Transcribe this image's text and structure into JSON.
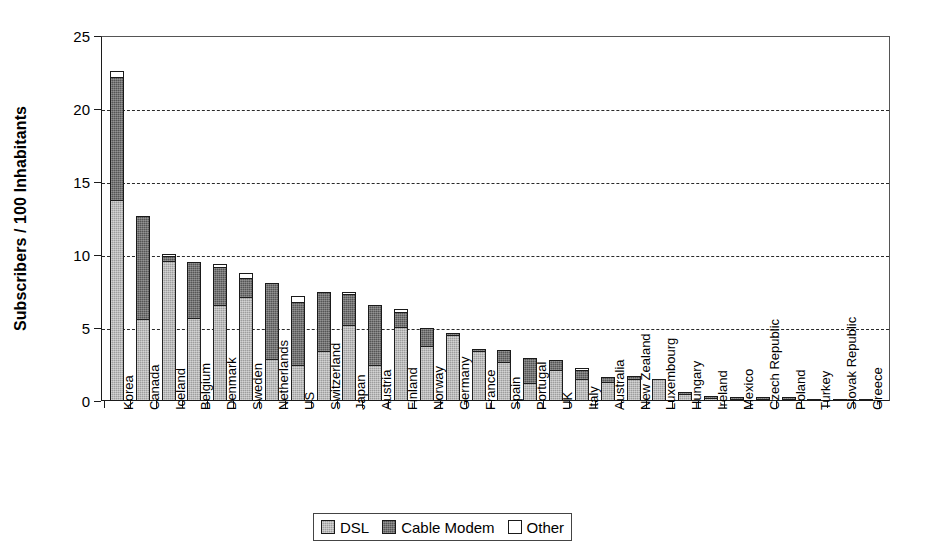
{
  "chart_data": {
    "type": "bar",
    "subtype": "stacked-vertical",
    "title": "",
    "xlabel": "",
    "ylabel": "Subscribers / 100 Inhabitants",
    "ylim": [
      0,
      25
    ],
    "yticks": [
      0,
      5,
      10,
      15,
      20,
      25
    ],
    "grid": "horizontal-dashed",
    "legend_position": "bottom-center",
    "categories": [
      "Korea",
      "Canada",
      "Iceland",
      "Belgium",
      "Denmark",
      "Sweden",
      "Netherlands",
      "US",
      "Switzerland",
      "Japan",
      "Austria",
      "Finland",
      "Norway",
      "Germany",
      "France",
      "Spain",
      "Portugal",
      "UK",
      "Italy",
      "Australia",
      "New Zealand",
      "Luxembourg",
      "Hungary",
      "Ireland",
      "Mexico",
      "Czech Republic",
      "Poland",
      "Turkey",
      "Slovak Republic",
      "Greece"
    ],
    "series": [
      {
        "name": "DSL",
        "color": "#9d9d9d",
        "values": [
          13.8,
          5.6,
          9.6,
          5.7,
          6.6,
          7.1,
          2.9,
          2.5,
          3.4,
          5.2,
          2.5,
          5.1,
          3.8,
          4.55,
          3.4,
          2.7,
          1.2,
          2.1,
          1.5,
          1.3,
          1.5,
          1.5,
          0.45,
          0.2,
          0.06,
          0.05,
          0.06,
          0.02,
          0.02,
          0.02
        ]
      },
      {
        "name": "Cable Modem",
        "color": "#555555",
        "values": [
          8.4,
          7.1,
          0.35,
          3.8,
          2.6,
          1.3,
          5.2,
          4.3,
          4.1,
          2.1,
          4.1,
          1.0,
          1.2,
          0.05,
          0.1,
          0.8,
          1.75,
          0.7,
          0.65,
          0.35,
          0.2,
          0.0,
          0.1,
          0.05,
          0.09,
          0.05,
          0.02,
          0.0,
          0.0,
          0.0
        ]
      },
      {
        "name": "Other",
        "color": "#ffffff",
        "values": [
          0.4,
          0.0,
          0.15,
          0.0,
          0.2,
          0.4,
          0.0,
          0.4,
          0.0,
          0.1,
          0.0,
          0.2,
          0.0,
          0.0,
          0.0,
          0.0,
          0.0,
          0.0,
          0.05,
          0.0,
          0.0,
          0.0,
          0.0,
          0.0,
          0.0,
          0.0,
          0.0,
          0.0,
          0.0,
          0.0
        ]
      }
    ],
    "totals": [
      22.6,
      12.7,
      10.1,
      9.5,
      9.4,
      8.8,
      8.1,
      7.2,
      7.5,
      7.4,
      6.6,
      6.3,
      5.0,
      4.6,
      3.5,
      3.5,
      2.95,
      2.8,
      2.2,
      1.65,
      1.7,
      1.5,
      0.55,
      0.25,
      0.15,
      0.1,
      0.08,
      0.02,
      0.02,
      0.02
    ]
  },
  "legend": {
    "items": [
      {
        "label": "DSL",
        "swatch": "dsl"
      },
      {
        "label": "Cable Modem",
        "swatch": "cable"
      },
      {
        "label": "Other",
        "swatch": "other"
      }
    ]
  }
}
